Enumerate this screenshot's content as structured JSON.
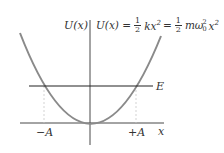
{
  "diagram": {
    "y_axis_label": "U(x)",
    "x_axis_label": "x",
    "energy_label": "E",
    "left_turning_point": "−A",
    "right_turning_point": "+A",
    "equation": {
      "lhs": "U(x) =",
      "frac1_num": "1",
      "frac1_den": "2",
      "term1": "kx",
      "term1_exp": "2",
      "eq2": "=",
      "frac2_num": "1",
      "frac2_den": "2",
      "term2": "mω",
      "term2_sup": "2",
      "term2_sub": "0",
      "term3": "x",
      "term3_exp": "2"
    },
    "colors": {
      "curve": "#8a8a8a",
      "axes": "#333333",
      "energy_line": "#222222",
      "guides": "#c8c8c8"
    }
  }
}
